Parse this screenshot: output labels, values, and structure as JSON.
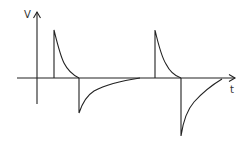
{
  "diagram": {
    "type": "waveform",
    "axes": {
      "y_label": "V",
      "x_label": "t"
    },
    "colors": {
      "stroke": "#222222",
      "background": "#ffffff"
    },
    "pulses": [
      {
        "index": 1,
        "positive_spike_x": 54,
        "negative_spike_x": 79
      },
      {
        "index": 2,
        "positive_spike_x": 155,
        "negative_spike_x": 181
      }
    ]
  }
}
